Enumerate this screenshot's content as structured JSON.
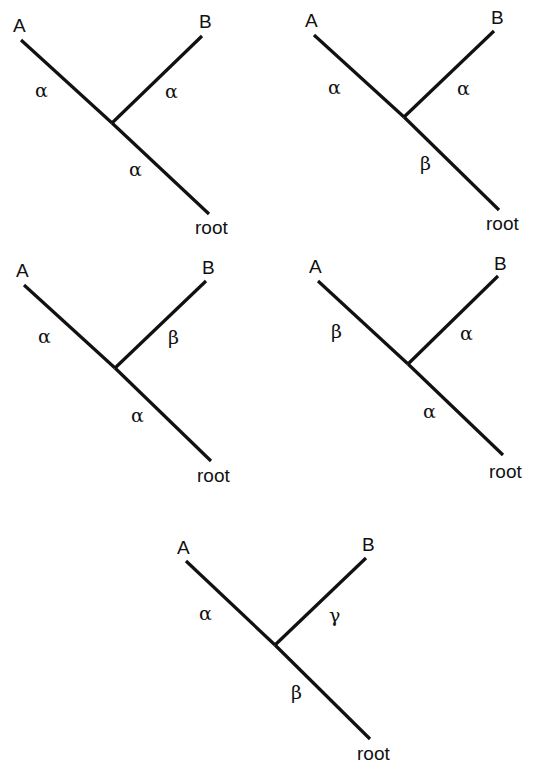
{
  "diagram": {
    "type": "phylogenetic-tree-set",
    "trees": [
      {
        "id": "tree-1",
        "labels": {
          "a": "A",
          "b": "B",
          "root": "root"
        },
        "branches": {
          "a": "α",
          "b": "α",
          "root": "α"
        }
      },
      {
        "id": "tree-2",
        "labels": {
          "a": "A",
          "b": "B",
          "root": "root"
        },
        "branches": {
          "a": "α",
          "b": "α",
          "root": "β"
        }
      },
      {
        "id": "tree-3",
        "labels": {
          "a": "A",
          "b": "B",
          "root": "root"
        },
        "branches": {
          "a": "α",
          "b": "β",
          "root": "α"
        }
      },
      {
        "id": "tree-4",
        "labels": {
          "a": "A",
          "b": "B",
          "root": "root"
        },
        "branches": {
          "a": "β",
          "b": "α",
          "root": "α"
        }
      },
      {
        "id": "tree-5",
        "labels": {
          "a": "A",
          "b": "B",
          "root": "root"
        },
        "branches": {
          "a": "α",
          "b": "γ",
          "root": "β"
        }
      }
    ]
  }
}
